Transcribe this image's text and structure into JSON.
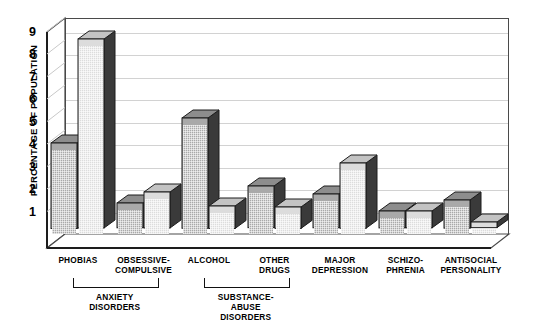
{
  "chart_data": {
    "type": "bar",
    "title": "",
    "xlabel": "",
    "ylabel": "PERCENTAGE OF POPULATION",
    "ylim": [
      0,
      9.6
    ],
    "yticks": [
      "1",
      "2",
      "3",
      "4",
      "5",
      "6",
      "7",
      "8",
      "9"
    ],
    "grid": true,
    "legend": "none",
    "style": "3d-clustered-bar",
    "categories": [
      "PHOBIAS",
      "OBSESSIVE-\nCOMPULSIVE",
      "ALCOHOL",
      "OTHER\nDRUGS",
      "MAJOR\nDEPRESSION",
      "SCHIZO-\nPHRENIA",
      "ANTISOCIAL\nPERSONALITY"
    ],
    "series": [
      {
        "name": "series-1",
        "fill": "medium-gray",
        "values": [
          3.8,
          1.1,
          4.9,
          1.85,
          1.5,
          0.75,
          1.25
        ]
      },
      {
        "name": "series-2",
        "fill": "light-gray",
        "values": [
          8.4,
          1.6,
          1.0,
          0.95,
          2.9,
          0.75,
          0.25
        ]
      }
    ],
    "group_brackets": [
      {
        "label": "ANXIETY\nDISORDERS",
        "spans": [
          "PHOBIAS",
          "OBSESSIVE-COMPULSIVE"
        ]
      },
      {
        "label": "SUBSTANCE-\nABUSE\nDISORDERS",
        "spans": [
          "ALCOHOL",
          "OTHER DRUGS"
        ]
      }
    ]
  },
  "axis": {
    "y_title": "PERCENTAGE OF POPULATION",
    "ticks": [
      "9",
      "8",
      "7",
      "6",
      "5",
      "4",
      "3",
      "2",
      "1"
    ]
  },
  "categories": [
    {
      "line1": "PHOBIAS",
      "line2": ""
    },
    {
      "line1": "OBSESSIVE-",
      "line2": "COMPULSIVE"
    },
    {
      "line1": "ALCOHOL",
      "line2": ""
    },
    {
      "line1": "OTHER",
      "line2": "DRUGS"
    },
    {
      "line1": "MAJOR",
      "line2": "DEPRESSION"
    },
    {
      "line1": "SCHIZO-",
      "line2": "PHRENIA"
    },
    {
      "line1": "ANTISOCIAL",
      "line2": "PERSONALITY"
    }
  ],
  "groups": [
    {
      "line1": "ANXIETY",
      "line2": "DISORDERS",
      "line3": ""
    },
    {
      "line1": "SUBSTANCE-",
      "line2": "ABUSE",
      "line3": "DISORDERS"
    }
  ],
  "colors": {
    "series1": "#a9a9a9",
    "series2": "#dcdcdc",
    "side": "#3a3a3a",
    "grid": "#d2d2d2",
    "axis": "#2b2b2b"
  }
}
